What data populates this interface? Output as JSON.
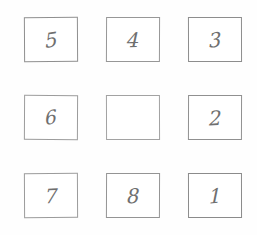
{
  "board": {
    "title": "8-Puzzle Grid",
    "rows": 3,
    "columns": 3,
    "background_color": "#fefefe",
    "tile_border_color": "#9a9a9a",
    "tile_fill_color": "#ffffff",
    "digit_color": "#6f6f6f",
    "blank_index": 4,
    "tiles": [
      {
        "label": "5",
        "name": "tile-5",
        "blank": false
      },
      {
        "label": "4",
        "name": "tile-4",
        "blank": false
      },
      {
        "label": "3",
        "name": "tile-3",
        "blank": false
      },
      {
        "label": "6",
        "name": "tile-6",
        "blank": false
      },
      {
        "label": "",
        "name": "tile-blank",
        "blank": true
      },
      {
        "label": "2",
        "name": "tile-2",
        "blank": false
      },
      {
        "label": "7",
        "name": "tile-7",
        "blank": false
      },
      {
        "label": "8",
        "name": "tile-8",
        "blank": false
      },
      {
        "label": "1",
        "name": "tile-1",
        "blank": false
      }
    ]
  }
}
